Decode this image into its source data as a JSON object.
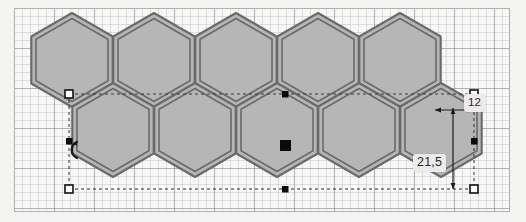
{
  "app": {
    "document_type": "vector-drawing-canvas",
    "background_color": "#f3f3f1",
    "sheet_color": "#f7f7f5",
    "sheet_border_color": "#b0b0ac"
  },
  "grid": {
    "minor_spacing_px": 8,
    "major_spacing_px": 40,
    "minor_color": "#96a0af",
    "major_color": "#7887 9b",
    "visible": true
  },
  "shape": {
    "name": "hexagon-honeycomb-pattern",
    "fill_color": "#b6b6b6",
    "stroke_color": "#6a6a6a",
    "stroke_style": "double-outline",
    "rows": 2,
    "top_row_count": 5,
    "bottom_row_count": 5,
    "total_tiles": 10
  },
  "selection": {
    "active": true,
    "bounding_box_style": "dashed",
    "bounding_box_color": "#333333",
    "handle_fill_empty": "#ffffff",
    "handle_fill_solid": "#000000",
    "handle_border": "#1a1a1a",
    "corner_handles": [
      {
        "name": "handle-top-left",
        "type": "hollow",
        "x": 68,
        "y": 93
      },
      {
        "name": "handle-top-right",
        "type": "hollow",
        "x": 473,
        "y": 93
      },
      {
        "name": "handle-bottom-left",
        "type": "hollow",
        "x": 68,
        "y": 188
      },
      {
        "name": "handle-bottom-right",
        "type": "hollow",
        "x": 473,
        "y": 188
      }
    ],
    "edge_handles": [
      {
        "name": "handle-top-center",
        "type": "solid",
        "x": 271,
        "y": 93
      },
      {
        "name": "handle-bottom-center",
        "type": "solid",
        "x": 271,
        "y": 188
      },
      {
        "name": "handle-middle-left",
        "type": "solid",
        "x": 68,
        "y": 141
      },
      {
        "name": "handle-middle-right",
        "type": "solid",
        "x": 473,
        "y": 141
      }
    ],
    "center_marker": {
      "name": "center-origin-marker",
      "type": "solid",
      "x": 271,
      "y": 145
    },
    "rotate_cursor": {
      "name": "rotate-cursor-icon",
      "x": 57,
      "y": 141
    }
  },
  "dimensions": {
    "width_label": "12",
    "height_label": "21,5",
    "unit_separator": "comma",
    "leader_color": "#1c1c1c",
    "chip_background": "#eceaea"
  }
}
